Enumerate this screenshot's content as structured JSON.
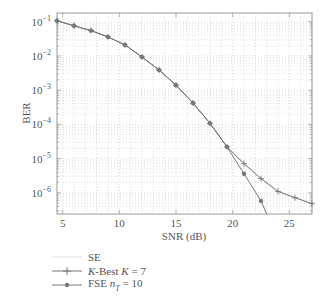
{
  "chart_data": {
    "type": "line",
    "title": "",
    "xlabel": "SNR (dB)",
    "ylabel": "BER",
    "xscale": "linear",
    "yscale": "log",
    "xlim": [
      4.5,
      27
    ],
    "ylim": [
      2.4e-07,
      0.18
    ],
    "xticks": [
      5,
      10,
      15,
      20,
      25
    ],
    "yticks": [
      "10^-1",
      "10^-2",
      "10^-3",
      "10^-4",
      "10^-5",
      "10^-6"
    ],
    "grid": true,
    "legend_position": "below",
    "series": [
      {
        "name": "SE",
        "color": "#d8d8d8",
        "marker": "none",
        "x": [
          4.5,
          6,
          7.5,
          9,
          10.5,
          12,
          13.5,
          15,
          16.5,
          18,
          19.5,
          21,
          22.5,
          24,
          25.5,
          27
        ],
        "y": [
          0.107,
          0.076,
          0.055,
          0.036,
          0.021,
          0.0093,
          0.0039,
          0.0014,
          0.00042,
          0.000107,
          2.2e-05,
          7.1e-06,
          2.6e-06,
          1.1e-06,
          7.2e-07,
          4.8e-07
        ]
      },
      {
        "name": "K-Best K = 7",
        "color": "#777777",
        "marker": "plus",
        "x": [
          4.5,
          6,
          7.5,
          9,
          10.5,
          12,
          13.5,
          15,
          16.5,
          18,
          19.5,
          21,
          22.5,
          24,
          25.5,
          27
        ],
        "y": [
          0.107,
          0.076,
          0.055,
          0.036,
          0.021,
          0.0093,
          0.0039,
          0.0014,
          0.00042,
          0.000107,
          2.2e-05,
          7.1e-06,
          2.6e-06,
          1.1e-06,
          7.2e-07,
          4.8e-07
        ]
      },
      {
        "name": "FSE n_T = 10",
        "color": "#777777",
        "marker": "dot",
        "x": [
          4.5,
          6,
          7.5,
          9,
          10.5,
          12,
          13.5,
          15,
          16.5,
          18,
          19.5,
          21,
          22.5,
          23
        ],
        "y": [
          0.107,
          0.076,
          0.055,
          0.036,
          0.021,
          0.0093,
          0.0039,
          0.0014,
          0.00042,
          0.000107,
          2.2e-05,
          3.6e-06,
          5.8e-07,
          2.4e-07
        ]
      }
    ]
  },
  "legend": {
    "se": "SE",
    "kbest_prefix": "K",
    "kbest_mid": "-Best ",
    "kbest_k": "K",
    "kbest_suffix": " = 7",
    "fse_prefix": "FSE ",
    "fse_n": "n",
    "fse_sub": "T",
    "fse_suffix": " = 10"
  }
}
